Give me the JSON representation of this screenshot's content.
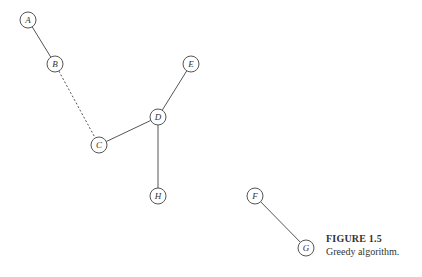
{
  "diagram": {
    "nodes": [
      {
        "id": "A",
        "label": "A",
        "x": 28,
        "y": 20
      },
      {
        "id": "B",
        "label": "B",
        "x": 55,
        "y": 64
      },
      {
        "id": "C",
        "label": "C",
        "x": 99,
        "y": 145
      },
      {
        "id": "D",
        "label": "D",
        "x": 158,
        "y": 117
      },
      {
        "id": "E",
        "label": "E",
        "x": 191,
        "y": 64
      },
      {
        "id": "H",
        "label": "H",
        "x": 158,
        "y": 196
      },
      {
        "id": "F",
        "label": "F",
        "x": 255,
        "y": 196
      },
      {
        "id": "G",
        "label": "G",
        "x": 306,
        "y": 248
      }
    ],
    "edges": [
      {
        "from": "A",
        "to": "B",
        "style": "solid"
      },
      {
        "from": "B",
        "to": "C",
        "style": "dashed"
      },
      {
        "from": "C",
        "to": "D",
        "style": "solid"
      },
      {
        "from": "D",
        "to": "E",
        "style": "solid"
      },
      {
        "from": "D",
        "to": "H",
        "style": "solid"
      },
      {
        "from": "F",
        "to": "G",
        "style": "solid"
      }
    ]
  },
  "caption": {
    "title": "FIGURE 1.5",
    "text": "Greedy algorithm."
  }
}
